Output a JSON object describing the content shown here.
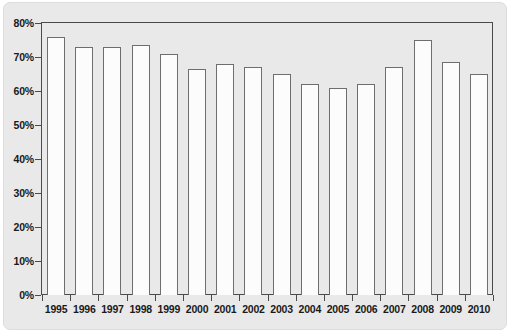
{
  "chart_data": {
    "type": "bar",
    "title": "",
    "subtitle": "",
    "xlabel": "",
    "ylabel": "",
    "categories": [
      "1995",
      "1996",
      "1997",
      "1998",
      "1999",
      "2000",
      "2001",
      "2002",
      "2003",
      "2004",
      "2005",
      "2006",
      "2007",
      "2008",
      "2009",
      "2010"
    ],
    "values": [
      76,
      73,
      73,
      73.5,
      71,
      66.5,
      68,
      67,
      65,
      62,
      61,
      62,
      67,
      75,
      68.5,
      65
    ],
    "series": [
      {
        "name": "",
        "values": [
          76,
          73,
          73,
          73.5,
          71,
          66.5,
          68,
          67,
          65,
          62,
          61,
          62,
          67,
          75,
          68.5,
          65
        ]
      }
    ],
    "ylim": [
      0,
      80
    ],
    "yticks": [
      0,
      10,
      20,
      30,
      40,
      50,
      60,
      70,
      80
    ],
    "ytick_labels": [
      "0%",
      "10%",
      "20%",
      "30%",
      "40%",
      "50%",
      "60%",
      "70%",
      "80%"
    ],
    "grid": false,
    "legend": false,
    "legend_position": "none",
    "annotations": []
  },
  "style": {
    "panel_background": "#e9e9e9",
    "plot_background": "#e9e9e9",
    "bar_fill": "#fcfcfc",
    "bar_edge": "#6e6e6e",
    "axis_color": "#4a4a4a",
    "text_color": "#1a1a1a"
  }
}
